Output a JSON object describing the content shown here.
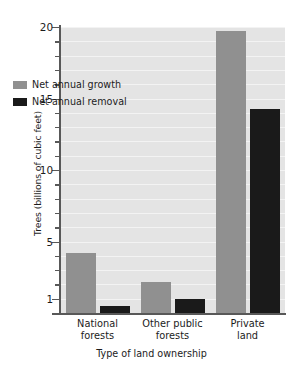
{
  "chart_data": {
    "type": "bar",
    "title": "",
    "xlabel": "Type of land ownership",
    "ylabel": "Trees (billions of cubic feet)",
    "categories": [
      "National forests",
      "Other public forests",
      "Private land"
    ],
    "category_lines": [
      [
        "National",
        "forests"
      ],
      [
        "Other public",
        "forests"
      ],
      [
        "Private",
        "land"
      ]
    ],
    "series": [
      {
        "name": "Net annual growth",
        "color": "#909090",
        "values": [
          4.2,
          2.2,
          19.7
        ]
      },
      {
        "name": "Net annual removal",
        "color": "#1a1a1a",
        "values": [
          0.5,
          1.0,
          14.3
        ]
      }
    ],
    "ylim": [
      0,
      20
    ],
    "y_major_ticks": [
      20,
      15,
      10,
      5,
      1
    ],
    "y_tick_labels": [
      "20",
      "15",
      "10",
      "5",
      "1"
    ],
    "y_minor_tick_interval": 1,
    "grid": true,
    "grid_color": "#f3f3f3",
    "plot_background": "#e4e4e4",
    "legend_position": "upper left inside"
  },
  "axis": {
    "y_title": "Trees (billions of cubic feet)",
    "x_title": "Type of land ownership"
  },
  "legend": {
    "items": [
      {
        "label": "Net annual growth",
        "color": "#909090"
      },
      {
        "label": "Net annual removal",
        "color": "#1a1a1a"
      }
    ]
  }
}
